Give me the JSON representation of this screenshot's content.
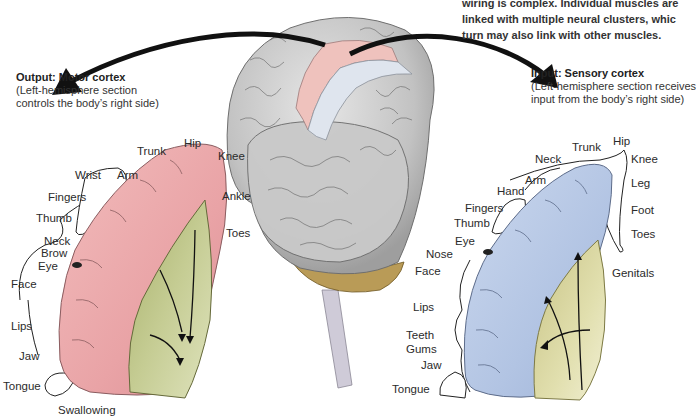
{
  "intro_text": {
    "lines": [
      "wiring is complex. Individual muscles are",
      "linked with multiple neural clusters, whic",
      "turn may also link with other muscles."
    ]
  },
  "motor": {
    "title": "Output: Motor cortex",
    "subtitle_lines": [
      "(Left-hemisphere section",
      "controls the body’s right side)"
    ],
    "color": "#e9a8a8",
    "labels": {
      "trunk": "Trunk",
      "hip": "Hip",
      "knee": "Knee",
      "wrist": "Wrist",
      "arm": "Arm",
      "ankle": "Ankle",
      "fingers": "Fingers",
      "thumb": "Thumb",
      "toes": "Toes",
      "neck": "Neck",
      "brow": "Brow",
      "eye": "Eye",
      "face": "Face",
      "lips": "Lips",
      "jaw": "Jaw",
      "tongue": "Tongue",
      "swallowing": "Swallowing"
    }
  },
  "sensory": {
    "title": "Input: Sensory cortex",
    "subtitle_lines": [
      "(Left-hemisphere section receives",
      "input from the body’s right side)"
    ],
    "color": "#b4c6e4",
    "labels": {
      "hip": "Hip",
      "trunk": "Trunk",
      "neck": "Neck",
      "knee": "Knee",
      "arm": "Arm",
      "leg": "Leg",
      "hand": "Hand",
      "fingers": "Fingers",
      "foot": "Foot",
      "thumb": "Thumb",
      "toes": "Toes",
      "eye": "Eye",
      "nose": "Nose",
      "face": "Face",
      "genitals": "Genitals",
      "lips": "Lips",
      "teeth": "Teeth",
      "gums": "Gums",
      "jaw": "Jaw",
      "tongue": "Tongue"
    }
  },
  "colors": {
    "brain_gray": "#c9c9c9",
    "white_matter": "#c3c98f",
    "cerebellum": "#b89a55",
    "arrow": "#111111"
  }
}
